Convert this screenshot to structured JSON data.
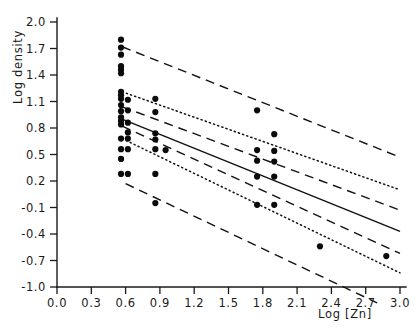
{
  "figure": {
    "background_color": "#ffffff",
    "ink_color": "#111111"
  },
  "axes": {
    "y_title": "Log density",
    "x_title": "Log [Zn]",
    "x_tick_labels": [
      "0.0",
      "0.3",
      "0.6",
      "0.9",
      "1.2",
      "1.5",
      "1.8",
      "2.1",
      "2.4",
      "2.7",
      "3.0"
    ],
    "y_tick_labels": [
      "2.0",
      "1.7",
      "1.4",
      "1.1",
      "0.8",
      "0.5",
      "0.2",
      "-0.1",
      "-0.4",
      "-0.7",
      "-1.0"
    ]
  },
  "chart_data": {
    "type": "scatter",
    "title": "",
    "subtitle": "",
    "xlabel": "Log [Zn]",
    "ylabel": "Log density",
    "xlim": [
      0.0,
      3.0
    ],
    "ylim": [
      -1.0,
      2.0
    ],
    "xticks": [
      0.0,
      0.3,
      0.6,
      0.9,
      1.2,
      1.5,
      1.8,
      2.1,
      2.4,
      2.7,
      3.0
    ],
    "yticks": [
      2.0,
      1.7,
      1.4,
      1.1,
      0.8,
      0.5,
      0.2,
      -0.1,
      -0.4,
      -0.7,
      -1.0
    ],
    "grid": false,
    "legend": null,
    "marker": "filled-circle",
    "points": [
      {
        "x": 0.56,
        "y": 1.8
      },
      {
        "x": 0.56,
        "y": 1.71
      },
      {
        "x": 0.56,
        "y": 1.63
      },
      {
        "x": 0.56,
        "y": 1.5
      },
      {
        "x": 0.56,
        "y": 1.46
      },
      {
        "x": 0.56,
        "y": 1.42
      },
      {
        "x": 0.56,
        "y": 1.21
      },
      {
        "x": 0.56,
        "y": 1.17
      },
      {
        "x": 0.56,
        "y": 1.13
      },
      {
        "x": 0.56,
        "y": 1.06
      },
      {
        "x": 0.56,
        "y": 0.99
      },
      {
        "x": 0.56,
        "y": 0.92
      },
      {
        "x": 0.56,
        "y": 0.88
      },
      {
        "x": 0.56,
        "y": 0.84
      },
      {
        "x": 0.56,
        "y": 0.68
      },
      {
        "x": 0.56,
        "y": 0.56
      },
      {
        "x": 0.56,
        "y": 0.45
      },
      {
        "x": 0.56,
        "y": 0.28
      },
      {
        "x": 0.62,
        "y": 1.12
      },
      {
        "x": 0.62,
        "y": 1.0
      },
      {
        "x": 0.62,
        "y": 0.86
      },
      {
        "x": 0.62,
        "y": 0.75
      },
      {
        "x": 0.62,
        "y": 0.68
      },
      {
        "x": 0.62,
        "y": 0.56
      },
      {
        "x": 0.62,
        "y": 0.28
      },
      {
        "x": 0.86,
        "y": 1.13
      },
      {
        "x": 0.86,
        "y": 0.98
      },
      {
        "x": 0.86,
        "y": 0.74
      },
      {
        "x": 0.86,
        "y": 0.67
      },
      {
        "x": 0.86,
        "y": 0.56
      },
      {
        "x": 0.86,
        "y": 0.28
      },
      {
        "x": 0.86,
        "y": -0.05
      },
      {
        "x": 0.95,
        "y": 0.55
      },
      {
        "x": 1.75,
        "y": 1.0
      },
      {
        "x": 1.75,
        "y": 0.55
      },
      {
        "x": 1.75,
        "y": 0.43
      },
      {
        "x": 1.75,
        "y": 0.25
      },
      {
        "x": 1.75,
        "y": -0.07
      },
      {
        "x": 1.9,
        "y": 0.73
      },
      {
        "x": 1.9,
        "y": 0.54
      },
      {
        "x": 1.9,
        "y": 0.42
      },
      {
        "x": 1.9,
        "y": 0.25
      },
      {
        "x": 1.9,
        "y": -0.07
      },
      {
        "x": 2.3,
        "y": -0.54
      },
      {
        "x": 2.88,
        "y": -0.65
      }
    ],
    "lines": [
      {
        "name": "upper-prediction-limit",
        "style": "dashed",
        "x_start": 0.57,
        "y_start": 1.72,
        "x_end": 3.0,
        "y_end": 0.47
      },
      {
        "name": "upper-confidence-limit",
        "style": "dotted",
        "x_start": 0.57,
        "y_start": 1.21,
        "x_end": 3.0,
        "y_end": 0.1
      },
      {
        "name": "upper-inner-limit",
        "style": "dashed",
        "x_start": 0.57,
        "y_start": 1.04,
        "x_end": 3.0,
        "y_end": -0.13
      },
      {
        "name": "regression-line",
        "style": "solid",
        "x_start": 0.57,
        "y_start": 0.9,
        "x_end": 3.0,
        "y_end": -0.37
      },
      {
        "name": "lower-inner-limit",
        "style": "dashed",
        "x_start": 0.57,
        "y_start": 0.82,
        "x_end": 3.0,
        "y_end": -0.62
      },
      {
        "name": "lower-confidence-limit",
        "style": "dotted",
        "x_start": 0.57,
        "y_start": 0.68,
        "x_end": 3.0,
        "y_end": -0.84
      },
      {
        "name": "lower-prediction-limit",
        "style": "dashed",
        "x_start": 0.6,
        "y_start": 0.17,
        "x_end": 2.8,
        "y_end": -1.18
      }
    ]
  }
}
